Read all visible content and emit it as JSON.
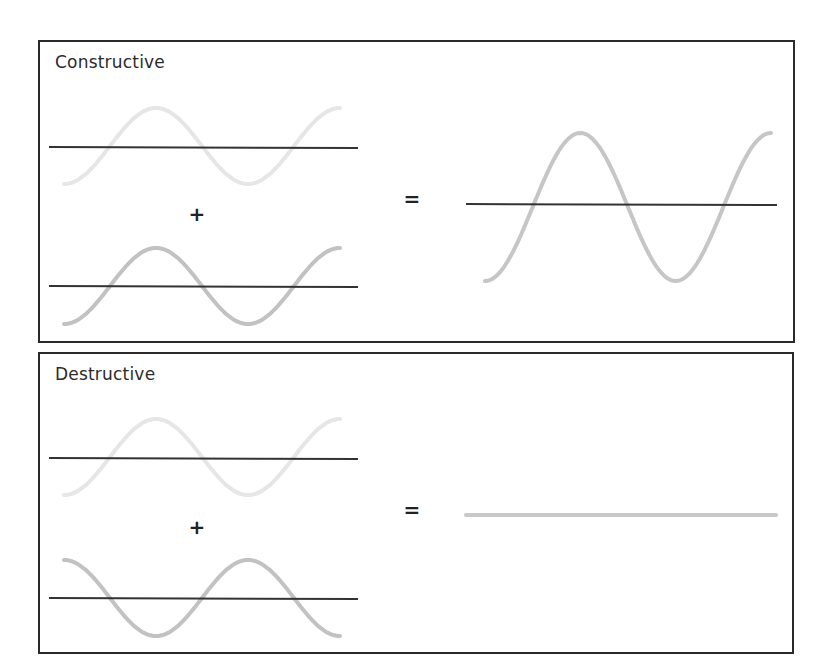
{
  "figure": {
    "panels": [
      {
        "id": "constructive",
        "title": "Constructive",
        "operator_plus": "+",
        "operator_equal": "=",
        "input_waves": [
          {
            "name": "wave-1",
            "amplitude": 1,
            "phase": "in-phase",
            "cycles": 1.5,
            "color": "#e6e6e6"
          },
          {
            "name": "wave-2",
            "amplitude": 1,
            "phase": "in-phase",
            "cycles": 1.5,
            "color": "#c2c2c2"
          }
        ],
        "result": {
          "amplitude": 2,
          "cycles": 1.5,
          "color": "#c6c6c6",
          "description": "amplitudes add"
        }
      },
      {
        "id": "destructive",
        "title": "Destructive",
        "operator_plus": "+",
        "operator_equal": "=",
        "input_waves": [
          {
            "name": "wave-1",
            "amplitude": 1,
            "phase": "0",
            "cycles": 1.5,
            "color": "#e6e6e6"
          },
          {
            "name": "wave-2",
            "amplitude": 1,
            "phase": "180deg",
            "cycles": 1.5,
            "color": "#c2c2c2"
          }
        ],
        "result": {
          "amplitude": 0,
          "cycles": 1.5,
          "color": "#c8c8c8",
          "description": "waves cancel (flat line)"
        }
      }
    ],
    "colors": {
      "frame": "#2a2a2a",
      "baseline": "#333333",
      "text": "#2b2b2b"
    }
  }
}
